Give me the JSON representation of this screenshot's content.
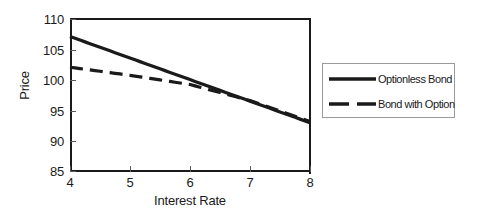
{
  "chart_data": {
    "type": "line",
    "title": "",
    "xlabel": "Interest Rate",
    "ylabel": "Price",
    "xlim": [
      4,
      8
    ],
    "ylim": [
      85,
      110
    ],
    "xticks": [
      "4",
      "5",
      "6",
      "7",
      "8"
    ],
    "yticks": [
      "110",
      "105",
      "100",
      "95",
      "90",
      "85"
    ],
    "grid": false,
    "legend_position": "right",
    "series": [
      {
        "name": "Optionless Bond",
        "style": "solid",
        "color": "#1a1a1a",
        "x": [
          4,
          5,
          6,
          7,
          8
        ],
        "values": [
          107,
          103.5,
          100,
          96.5,
          93
        ]
      },
      {
        "name": "Bond with Option",
        "style": "dashed",
        "color": "#1a1a1a",
        "x": [
          4,
          5,
          6,
          7,
          8
        ],
        "values": [
          102,
          100.7,
          99.2,
          96.6,
          93.2
        ]
      }
    ]
  },
  "axes": {
    "y_label": "Price",
    "x_label": "Interest Rate",
    "y_tick_labels": [
      "110",
      "105",
      "100",
      "95",
      "90",
      "85"
    ],
    "x_tick_labels": [
      "4",
      "5",
      "6",
      "7",
      "8"
    ]
  },
  "legend": {
    "entries": [
      {
        "label": "Optionless Bond",
        "style": "solid"
      },
      {
        "label": "Bond with Option",
        "style": "dashed"
      }
    ]
  }
}
